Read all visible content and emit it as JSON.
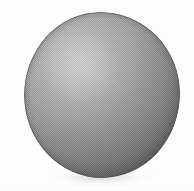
{
  "image": {
    "kind": "scanned-halftone-photograph",
    "subject": "sphere",
    "caption": "",
    "background_color": "#ffffff",
    "width_px": 194,
    "height_px": 191
  },
  "sphere": {
    "label": "sphere",
    "shape": "circle",
    "bounds_px": {
      "left": 24,
      "top": 12,
      "width": 156,
      "height": 166
    },
    "center_px": {
      "x": 102,
      "y": 95
    },
    "highlight_center_px": {
      "x": 77,
      "y": 58
    },
    "light_direction": "upper-left",
    "highlight_color": "#cdcdcd",
    "midtone_color": "#a4a4a4",
    "shadow_color": "#6b6b6b",
    "rim_outline_color": "#505050",
    "halftone_pitch_px": 2,
    "contour": "slightly irregular hand-traced circle"
  },
  "ground_shadow": {
    "label": "contact shadow",
    "bounds_px": {
      "left": 46,
      "top": 168,
      "width": 110,
      "height": 18
    },
    "color": "#9b9b9b",
    "opacity": 0.4
  }
}
